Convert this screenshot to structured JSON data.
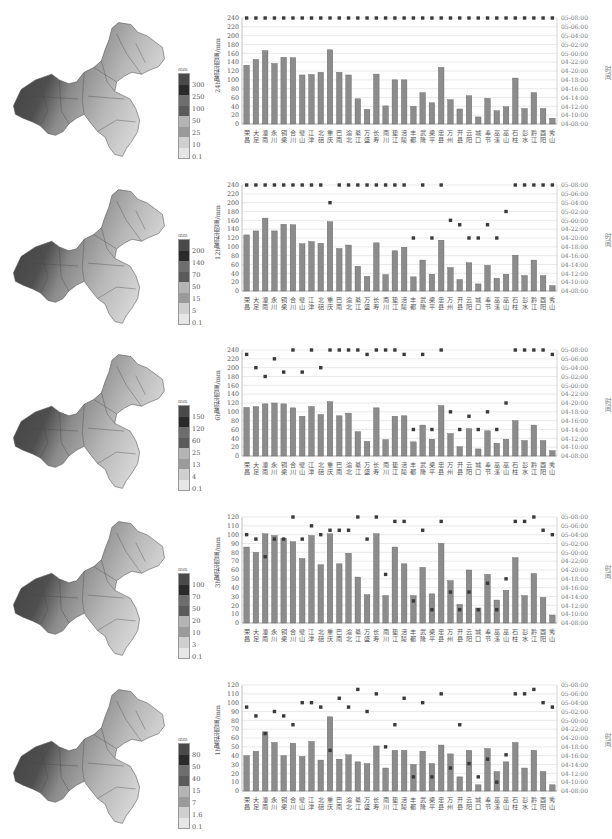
{
  "stations": [
    "荣昌",
    "大足",
    "潼南",
    "永川",
    "铜梁",
    "合川",
    "璧山",
    "江津",
    "北碚",
    "重庆",
    "巴南",
    "渝北",
    "綦江",
    "万盛",
    "长寿",
    "南川",
    "垫江",
    "涪陵",
    "丰都",
    "武隆",
    "梁平",
    "忠县",
    "万州",
    "开县",
    "云阳",
    "城口",
    "奉节",
    "巫溪",
    "巫山",
    "石柱",
    "彭水",
    "黔江",
    "酉阳",
    "秀山"
  ],
  "time_axis": {
    "label": "时间",
    "ticks": [
      "05-08:00",
      "05-06:00",
      "05-04:00",
      "05-02:00",
      "05-00:00",
      "04-22:00",
      "04-20:00",
      "04-18:00",
      "04-16:00",
      "04-14:00",
      "04-12:00",
      "04-10:00",
      "04-08:00"
    ]
  },
  "panels": [
    {
      "ylabel": "24h累积雨量/mm",
      "legend": {
        "unit": "mm",
        "ticks": [
          "300",
          "250",
          "100",
          "50",
          "25",
          "10",
          "0.1"
        ]
      },
      "ymax": 240,
      "ystep": 20
    },
    {
      "ylabel": "12h累积雨量/mm",
      "legend": {
        "unit": "mm",
        "ticks": [
          "200",
          "140",
          "70",
          "50",
          "15",
          "5",
          "0.1"
        ]
      },
      "ymax": 240,
      "ystep": 20
    },
    {
      "ylabel": "6h累积雨量/mm",
      "legend": {
        "unit": "mm",
        "ticks": [
          "150",
          "120",
          "60",
          "25",
          "13",
          "4",
          "0.1"
        ]
      },
      "ymax": 240,
      "ystep": 20
    },
    {
      "ylabel": "3h累积雨量/mm",
      "legend": {
        "unit": "mm",
        "ticks": [
          "100",
          "70",
          "50",
          "20",
          "10",
          "3",
          "0.1"
        ]
      },
      "ymax": 120,
      "ystep": 10
    },
    {
      "ylabel": "1h累积雨量/mm",
      "legend": {
        "unit": "mm",
        "ticks": [
          "80",
          "50",
          "40",
          "15",
          "7",
          "1.6",
          "0.1"
        ]
      },
      "ymax": 120,
      "ystep": 10
    }
  ],
  "chart_data": [
    {
      "type": "bar",
      "title": "",
      "xlabel": "",
      "ylabel": "24h累积雨量/mm",
      "y2label": "时间",
      "ylim": [
        0,
        240
      ],
      "y2lim": [
        "04-08:00",
        "05-08:00"
      ],
      "grid": true,
      "categories": [
        "荣昌",
        "大足",
        "潼南",
        "永川",
        "铜梁",
        "合川",
        "璧山",
        "江津",
        "北碚",
        "重庆",
        "巴南",
        "渝北",
        "綦江",
        "万盛",
        "长寿",
        "南川",
        "垫江",
        "涪陵",
        "丰都",
        "武隆",
        "梁平",
        "忠县",
        "万州",
        "开县",
        "云阳",
        "城口",
        "奉节",
        "巫溪",
        "巫山",
        "石柱",
        "彭水",
        "黔江",
        "酉阳",
        "秀山"
      ],
      "series": [
        {
          "name": "累积雨量",
          "kind": "bar",
          "values": [
            133,
            146,
            166,
            137,
            151,
            150,
            111,
            112,
            117,
            168,
            117,
            111,
            57,
            33,
            113,
            41,
            100,
            100,
            40,
            71,
            48,
            128,
            55,
            34,
            64,
            16,
            58,
            30,
            39,
            104,
            35,
            71,
            35,
            13
          ]
        },
        {
          "name": "时间",
          "kind": "marker",
          "axis": "y2",
          "values_y": [
            240,
            240,
            240,
            240,
            240,
            240,
            240,
            240,
            240,
            240,
            240,
            240,
            240,
            240,
            240,
            240,
            240,
            240,
            240,
            240,
            240,
            240,
            240,
            240,
            240,
            240,
            240,
            240,
            240,
            240,
            240,
            240,
            240,
            240
          ]
        }
      ]
    },
    {
      "type": "bar",
      "title": "",
      "xlabel": "",
      "ylabel": "12h累积雨量/mm",
      "y2label": "时间",
      "ylim": [
        0,
        240
      ],
      "y2lim": [
        "04-08:00",
        "05-08:00"
      ],
      "grid": true,
      "categories": [
        "荣昌",
        "大足",
        "潼南",
        "永川",
        "铜梁",
        "合川",
        "璧山",
        "江津",
        "北碚",
        "重庆",
        "巴南",
        "渝北",
        "綦江",
        "万盛",
        "长寿",
        "南川",
        "垫江",
        "涪陵",
        "丰都",
        "武隆",
        "梁平",
        "忠县",
        "万州",
        "开县",
        "云阳",
        "城口",
        "奉节",
        "巫溪",
        "巫山",
        "石柱",
        "彭水",
        "黔江",
        "酉阳",
        "秀山"
      ],
      "series": [
        {
          "name": "累积雨量",
          "kind": "bar",
          "values": [
            127,
            136,
            165,
            136,
            151,
            150,
            107,
            112,
            108,
            157,
            96,
            104,
            56,
            33,
            109,
            37,
            91,
            99,
            32,
            70,
            38,
            115,
            53,
            26,
            64,
            16,
            58,
            29,
            38,
            81,
            35,
            70,
            35,
            12
          ]
        },
        {
          "name": "时间",
          "kind": "marker",
          "axis": "y2",
          "values_y": [
            240,
            240,
            240,
            240,
            240,
            240,
            240,
            240,
            240,
            200,
            240,
            240,
            240,
            240,
            240,
            240,
            240,
            240,
            120,
            240,
            120,
            240,
            160,
            150,
            120,
            120,
            150,
            120,
            180,
            240,
            240,
            240,
            240,
            240
          ]
        }
      ]
    },
    {
      "type": "bar",
      "title": "",
      "xlabel": "",
      "ylabel": "6h累积雨量/mm",
      "y2label": "时间",
      "ylim": [
        0,
        240
      ],
      "y2lim": [
        "04-08:00",
        "05-08:00"
      ],
      "grid": true,
      "categories": [
        "荣昌",
        "大足",
        "潼南",
        "永川",
        "铜梁",
        "合川",
        "璧山",
        "江津",
        "北碚",
        "重庆",
        "巴南",
        "渝北",
        "綦江",
        "万盛",
        "长寿",
        "南川",
        "垫江",
        "涪陵",
        "丰都",
        "武隆",
        "梁平",
        "忠县",
        "万州",
        "开县",
        "云阳",
        "城口",
        "奉节",
        "巫溪",
        "巫山",
        "石柱",
        "彭水",
        "黔江",
        "酉阳",
        "秀山"
      ],
      "series": [
        {
          "name": "累积雨量",
          "kind": "bar",
          "values": [
            110,
            112,
            118,
            120,
            118,
            109,
            90,
            112,
            94,
            123,
            91,
            97,
            55,
            33,
            109,
            37,
            90,
            91,
            32,
            70,
            38,
            114,
            51,
            21,
            62,
            16,
            57,
            29,
            38,
            80,
            35,
            70,
            35,
            12
          ]
        },
        {
          "name": "时间",
          "kind": "marker",
          "axis": "y2",
          "values_y": [
            230,
            200,
            180,
            220,
            190,
            240,
            190,
            240,
            200,
            240,
            240,
            240,
            240,
            230,
            240,
            240,
            240,
            230,
            60,
            230,
            60,
            240,
            100,
            60,
            90,
            60,
            100,
            60,
            120,
            240,
            240,
            240,
            240,
            230
          ]
        }
      ]
    },
    {
      "type": "bar",
      "title": "",
      "xlabel": "",
      "ylabel": "3h累积雨量/mm",
      "y2label": "时间",
      "ylim": [
        0,
        120
      ],
      "y2lim": [
        "04-08:00",
        "05-08:00"
      ],
      "grid": true,
      "categories": [
        "荣昌",
        "大足",
        "潼南",
        "永川",
        "铜梁",
        "合川",
        "璧山",
        "江津",
        "北碚",
        "重庆",
        "巴南",
        "渝北",
        "綦江",
        "万盛",
        "长寿",
        "南川",
        "垫江",
        "涪陵",
        "丰都",
        "武隆",
        "梁平",
        "忠县",
        "万州",
        "开县",
        "云阳",
        "城口",
        "奉节",
        "巫溪",
        "巫山",
        "石柱",
        "彭水",
        "黔江",
        "酉阳",
        "秀山"
      ],
      "series": [
        {
          "name": "累积雨量",
          "kind": "bar",
          "values": [
            86,
            80,
            101,
            99,
            96,
            92,
            73,
            99,
            66,
            101,
            67,
            79,
            52,
            32,
            101,
            31,
            86,
            67,
            31,
            63,
            33,
            90,
            48,
            21,
            60,
            17,
            55,
            26,
            37,
            74,
            31,
            56,
            29,
            9
          ]
        },
        {
          "name": "时间",
          "kind": "marker",
          "axis": "y2",
          "values_y": [
            100,
            95,
            75,
            95,
            95,
            120,
            95,
            110,
            100,
            105,
            105,
            105,
            120,
            95,
            120,
            55,
            115,
            115,
            25,
            105,
            15,
            115,
            35,
            15,
            35,
            15,
            45,
            15,
            50,
            115,
            115,
            120,
            105,
            100
          ]
        }
      ]
    },
    {
      "type": "bar",
      "title": "",
      "xlabel": "",
      "ylabel": "1h累积雨量/mm",
      "y2label": "时间",
      "ylim": [
        0,
        120
      ],
      "y2lim": [
        "04-08:00",
        "05-08:00"
      ],
      "grid": true,
      "categories": [
        "荣昌",
        "大足",
        "潼南",
        "永川",
        "铜梁",
        "合川",
        "璧山",
        "江津",
        "北碚",
        "重庆",
        "巴南",
        "渝北",
        "綦江",
        "万盛",
        "长寿",
        "南川",
        "垫江",
        "涪陵",
        "丰都",
        "武隆",
        "梁平",
        "忠县",
        "万州",
        "开县",
        "云阳",
        "城口",
        "奉节",
        "巫溪",
        "巫山",
        "石柱",
        "彭水",
        "黔江",
        "酉阳",
        "秀山"
      ],
      "series": [
        {
          "name": "累积雨量",
          "kind": "bar",
          "values": [
            40,
            45,
            67,
            55,
            40,
            54,
            39,
            56,
            35,
            84,
            36,
            41,
            33,
            31,
            51,
            26,
            46,
            46,
            30,
            45,
            31,
            52,
            42,
            16,
            46,
            7,
            48,
            22,
            33,
            55,
            26,
            46,
            22,
            7
          ]
        },
        {
          "name": "时间",
          "kind": "marker",
          "axis": "y2",
          "values_y": [
            95,
            85,
            65,
            90,
            85,
            75,
            100,
            100,
            95,
            46,
            105,
            95,
            115,
            90,
            110,
            50,
            75,
            105,
            16,
            100,
            16,
            110,
            26,
            75,
            31,
            16,
            36,
            10,
            41,
            110,
            110,
            115,
            100,
            95
          ]
        }
      ]
    }
  ]
}
